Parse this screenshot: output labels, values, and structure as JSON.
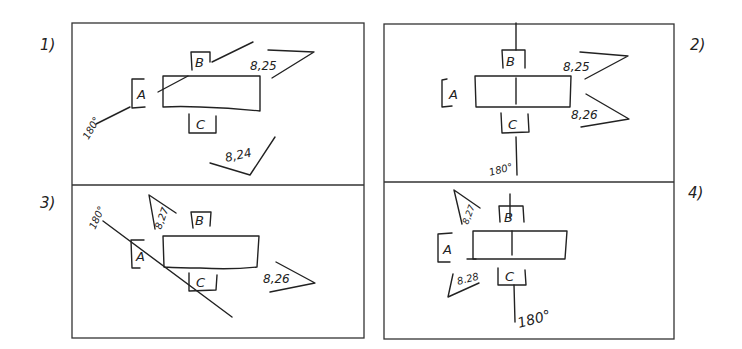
{
  "diagram": {
    "type": "hand-drawn sketch",
    "panels": [
      {
        "number": "1)",
        "labels": {
          "a": "A",
          "b": "B",
          "c": "C"
        },
        "angle": "180°",
        "flags": [
          "8,25",
          "8,24"
        ]
      },
      {
        "number": "2)",
        "labels": {
          "a": "A",
          "b": "B",
          "c": "C"
        },
        "angle": "180°",
        "flags": [
          "8,25",
          "8,26"
        ]
      },
      {
        "number": "3)",
        "labels": {
          "a": "A",
          "b": "B",
          "c": "C"
        },
        "angle": "180°",
        "flags": [
          "8,27",
          "8,26"
        ]
      },
      {
        "number": "4)",
        "labels": {
          "a": "A",
          "b": "B",
          "c": "C"
        },
        "angle": "180°",
        "flags": [
          "8,27",
          "8.28"
        ]
      }
    ]
  }
}
